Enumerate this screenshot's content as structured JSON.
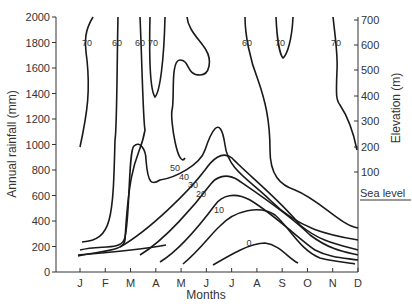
{
  "chart_data": {
    "type": "contour",
    "title": "",
    "xlabel": "Months",
    "ylabel": "Annual rainfall (mm)",
    "y2label": "Elevation (m)",
    "x_ticks": [
      "J",
      "F",
      "M",
      "A",
      "M",
      "J",
      "J",
      "A",
      "S",
      "O",
      "N",
      "D"
    ],
    "y_ticks": [
      0,
      200,
      400,
      600,
      800,
      1000,
      1200,
      1400,
      1600,
      1800,
      2000
    ],
    "y_range": [
      0,
      2000
    ],
    "y2_ticks": [
      "700",
      "600",
      "500",
      "400",
      "300",
      "200",
      "100",
      "Sea level"
    ],
    "contour_labels": [
      "70",
      "60",
      "60",
      "70",
      "60",
      "70",
      "70",
      "50",
      "40",
      "30",
      "20",
      "10",
      "0"
    ],
    "contour_levels": [
      0,
      10,
      20,
      30,
      40,
      50,
      60,
      70
    ],
    "grid": false,
    "legend": null
  }
}
